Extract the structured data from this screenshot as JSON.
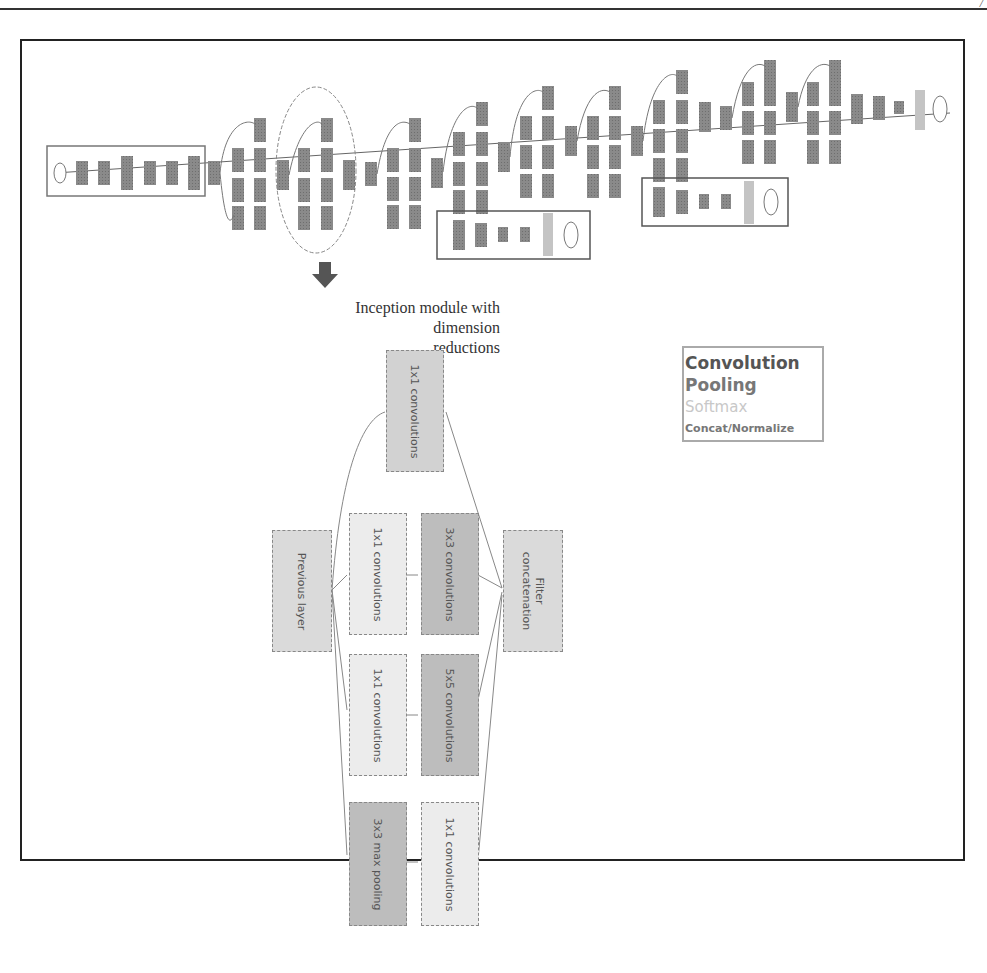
{
  "page": {
    "page_mark": "/"
  },
  "top_network": {
    "description": "GoogLeNet architecture overview",
    "highlight": "second inception module circled"
  },
  "caption": {
    "line1": "Inception module with dimension",
    "line2": "reductions"
  },
  "legend": {
    "items": [
      {
        "label": "Convolution",
        "color": "#555555"
      },
      {
        "label": "Pooling",
        "color": "#777777"
      },
      {
        "label": "Softmax",
        "color": "#c8c8c8"
      },
      {
        "label": "Concat/Normalize",
        "color": "#777777"
      }
    ]
  },
  "inception_module": {
    "previous_layer": "Previous layer",
    "top_conv": "1x1 convolutions",
    "reduce_3x3": "1x1 convolutions",
    "conv_3x3": "3x3 convolutions",
    "reduce_5x5": "1x1 convolutions",
    "conv_5x5": "5x5 convolutions",
    "max_pool": "3x3 max pooling",
    "pool_proj": "1x1 convolutions",
    "filter_concat_1": "Filter",
    "filter_concat_2": "concatenation"
  }
}
